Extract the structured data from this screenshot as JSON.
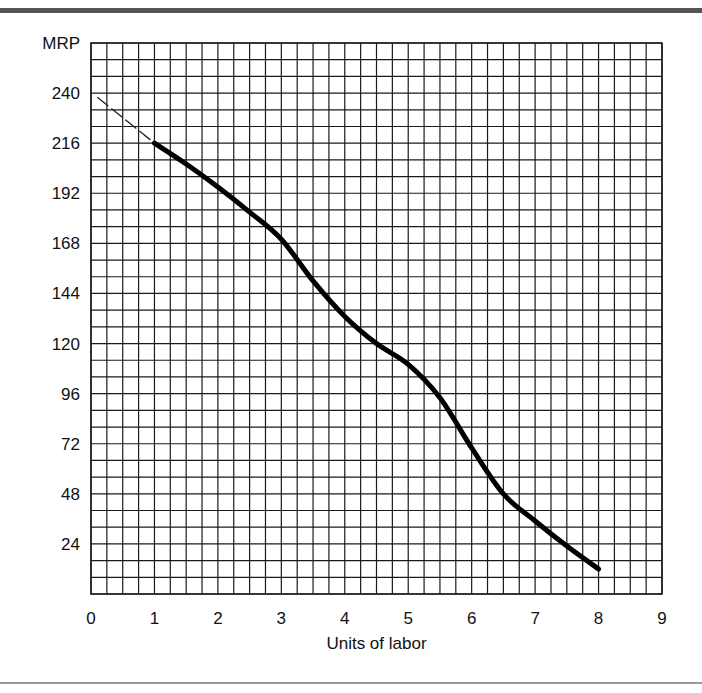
{
  "chart_data": {
    "type": "line",
    "title": "",
    "xlabel": "Units of labor",
    "ylabel": "MRP",
    "xlim": [
      0,
      9
    ],
    "ylim": [
      0,
      264
    ],
    "x_ticks": [
      0,
      1,
      2,
      3,
      4,
      5,
      6,
      7,
      8,
      9
    ],
    "x_tick_labels": [
      "0",
      "1",
      "2",
      "3",
      "4",
      "5",
      "6",
      "7",
      "8",
      "9"
    ],
    "y_ticks": [
      24,
      48,
      72,
      96,
      120,
      144,
      168,
      192,
      216,
      240
    ],
    "y_tick_labels": [
      "24",
      "48",
      "72",
      "96",
      "120",
      "144",
      "168",
      "192",
      "216",
      "240"
    ],
    "grid": true,
    "grid_minor_x_step": 0.25,
    "grid_minor_y_step": 8,
    "series": [
      {
        "name": "MRP curve",
        "style": "solid-thick",
        "x": [
          1,
          1.5,
          2,
          2.5,
          3,
          3.5,
          4,
          4.5,
          5,
          5.5,
          6,
          6.5,
          7,
          7.5,
          8
        ],
        "y": [
          216,
          206,
          195,
          183,
          170,
          150,
          133,
          120,
          110,
          94,
          70,
          48,
          35,
          23,
          12
        ]
      },
      {
        "name": "Extension to y-axis",
        "style": "dashed-thin",
        "x": [
          0.1,
          1
        ],
        "y": [
          238,
          216
        ]
      }
    ],
    "legend": "none"
  }
}
